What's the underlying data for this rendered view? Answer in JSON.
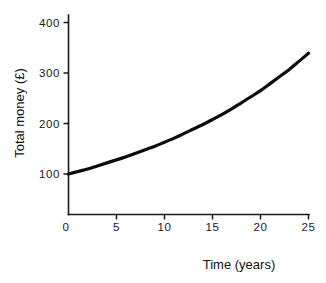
{
  "chart_data": {
    "type": "line",
    "title": "",
    "subtitle": "",
    "xlabel": "Time (years)",
    "ylabel": "Total money (£)",
    "xlim": [
      0,
      25
    ],
    "ylim": [
      0,
      400
    ],
    "grid": false,
    "legend": null,
    "legend_position": "none",
    "xticks": [
      0,
      5,
      10,
      15,
      20,
      25
    ],
    "xtick_labels": [
      "0",
      "5",
      "10",
      "15",
      "20",
      "25"
    ],
    "yticks": [
      100,
      200,
      300,
      400
    ],
    "ytick_labels": [
      "100",
      "200",
      "300",
      "400"
    ],
    "annotations": [],
    "series": [
      {
        "name": "Total money",
        "color": "#0c0c0c",
        "x": [
          0,
          1,
          2,
          3,
          4,
          5,
          6,
          7,
          8,
          9,
          10,
          11,
          12,
          13,
          14,
          15,
          16,
          17,
          18,
          19,
          20,
          21,
          22,
          23,
          24,
          25
        ],
        "values": [
          100,
          105,
          110,
          116,
          122,
          128,
          134,
          141,
          148,
          155,
          163,
          171,
          180,
          189,
          198,
          208,
          218,
          229,
          241,
          253,
          265,
          279,
          293,
          307,
          323,
          339
        ]
      }
    ]
  },
  "axes": {
    "x_axis_name": "time-axis",
    "y_axis_name": "money-axis"
  }
}
